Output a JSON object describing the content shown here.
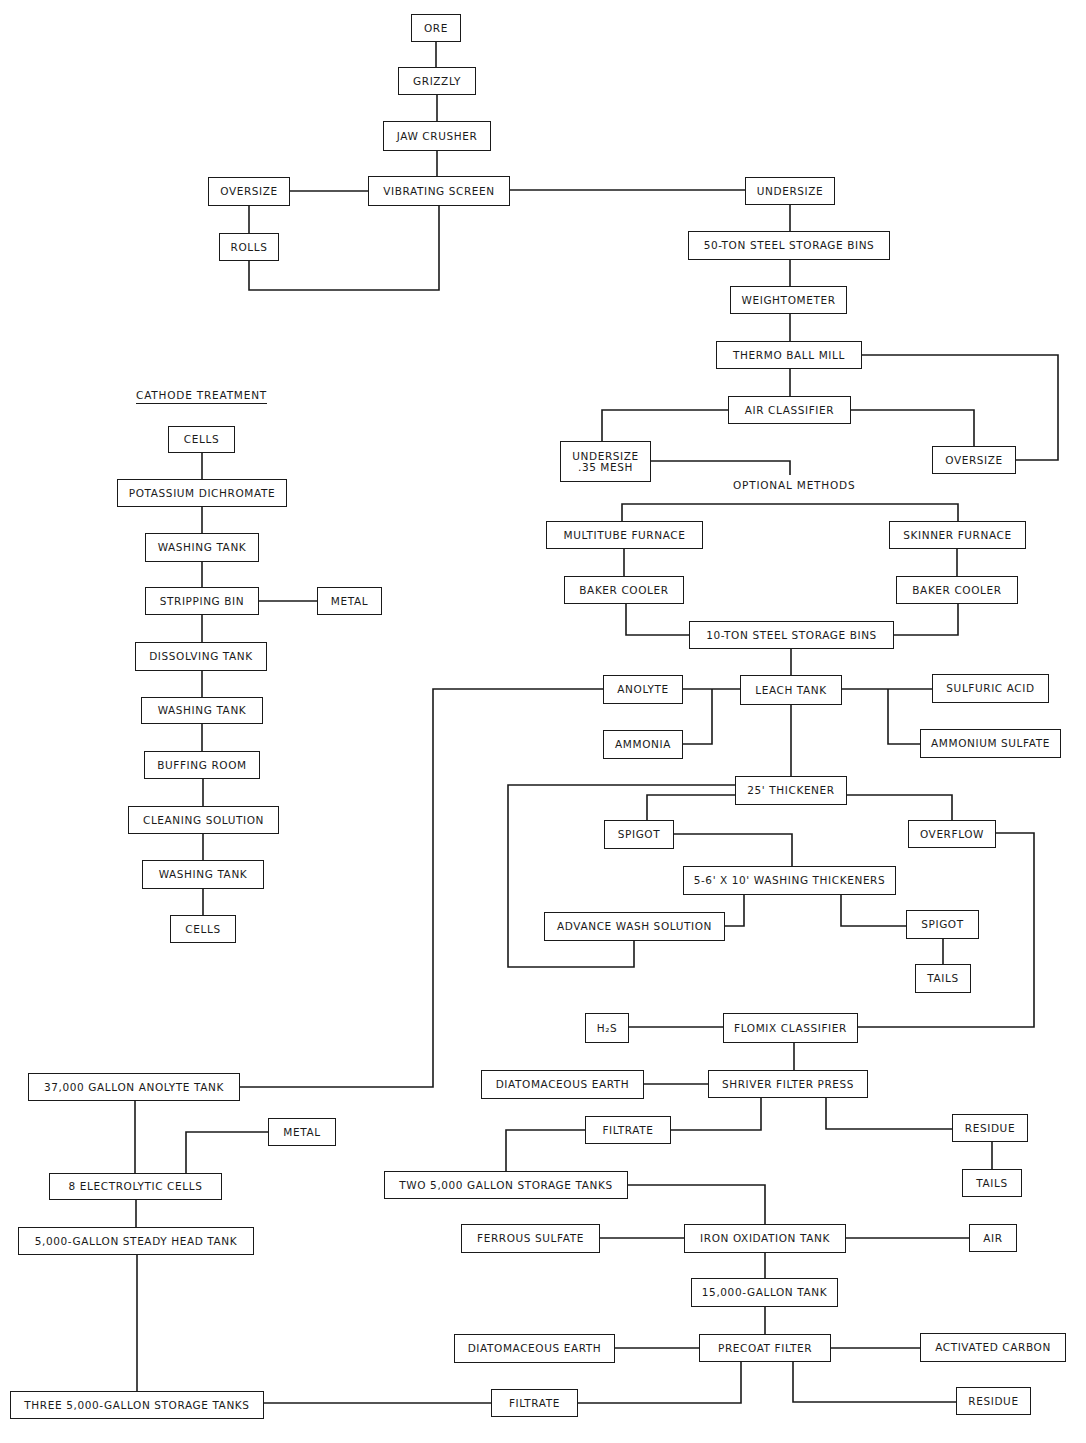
{
  "diagram": {
    "type": "process-flowsheet",
    "labels": {
      "cathode_treatment": "CATHODE TREATMENT",
      "optional_methods": "OPTIONAL METHODS"
    },
    "nodes": [
      {
        "id": "ore",
        "label": "ORE",
        "x": 411,
        "y": 14,
        "w": 50,
        "h": 28
      },
      {
        "id": "grizzly",
        "label": "GRIZZLY",
        "x": 398,
        "y": 67,
        "w": 78,
        "h": 28
      },
      {
        "id": "jaw_crusher",
        "label": "JAW CRUSHER",
        "x": 383,
        "y": 121,
        "w": 108,
        "h": 30
      },
      {
        "id": "vibrating_screen",
        "label": "VIBRATING SCREEN",
        "x": 368,
        "y": 176,
        "w": 142,
        "h": 30
      },
      {
        "id": "oversize_1",
        "label": "OVERSIZE",
        "x": 208,
        "y": 177,
        "w": 82,
        "h": 29
      },
      {
        "id": "rolls",
        "label": "ROLLS",
        "x": 219,
        "y": 233,
        "w": 60,
        "h": 28
      },
      {
        "id": "undersize_1",
        "label": "UNDERSIZE",
        "x": 745,
        "y": 177,
        "w": 90,
        "h": 28
      },
      {
        "id": "bins_50",
        "label": "50-TON STEEL STORAGE BINS",
        "x": 688,
        "y": 231,
        "w": 202,
        "h": 29
      },
      {
        "id": "weightometer",
        "label": "WEIGHTOMETER",
        "x": 730,
        "y": 286,
        "w": 117,
        "h": 28
      },
      {
        "id": "thermo_ball_mill",
        "label": "THERMO BALL MILL",
        "x": 716,
        "y": 341,
        "w": 146,
        "h": 28
      },
      {
        "id": "air_classifier",
        "label": "AIR CLASSIFIER",
        "x": 728,
        "y": 396,
        "w": 123,
        "h": 28
      },
      {
        "id": "undersize_35",
        "label": "UNDERSIZE\n.35 MESH",
        "x": 560,
        "y": 441,
        "w": 91,
        "h": 41
      },
      {
        "id": "oversize_2",
        "label": "OVERSIZE",
        "x": 932,
        "y": 446,
        "w": 84,
        "h": 28
      },
      {
        "id": "multitube_furnace",
        "label": "MULTITUBE FURNACE",
        "x": 546,
        "y": 521,
        "w": 157,
        "h": 28
      },
      {
        "id": "skinner_furnace",
        "label": "SKINNER FURNACE",
        "x": 889,
        "y": 521,
        "w": 137,
        "h": 28
      },
      {
        "id": "baker_cooler_1",
        "label": "BAKER COOLER",
        "x": 564,
        "y": 576,
        "w": 120,
        "h": 28
      },
      {
        "id": "baker_cooler_2",
        "label": "BAKER COOLER",
        "x": 896,
        "y": 576,
        "w": 122,
        "h": 28
      },
      {
        "id": "bins_10",
        "label": "10-TON STEEL STORAGE BINS",
        "x": 689,
        "y": 621,
        "w": 205,
        "h": 28
      },
      {
        "id": "leach_tank",
        "label": "LEACH TANK",
        "x": 740,
        "y": 675,
        "w": 102,
        "h": 30
      },
      {
        "id": "anolyte",
        "label": "ANOLYTE",
        "x": 603,
        "y": 675,
        "w": 80,
        "h": 29
      },
      {
        "id": "ammonia",
        "label": "AMMONIA",
        "x": 603,
        "y": 730,
        "w": 80,
        "h": 29
      },
      {
        "id": "sulfuric_acid",
        "label": "SULFURIC ACID",
        "x": 932,
        "y": 674,
        "w": 117,
        "h": 29
      },
      {
        "id": "ammonium_sulfate",
        "label": "AMMONIUM SULFATE",
        "x": 920,
        "y": 729,
        "w": 141,
        "h": 29
      },
      {
        "id": "thickener_25",
        "label": "25' THICKENER",
        "x": 735,
        "y": 776,
        "w": 112,
        "h": 29
      },
      {
        "id": "spigot_1",
        "label": "SPIGOT",
        "x": 604,
        "y": 820,
        "w": 70,
        "h": 29
      },
      {
        "id": "overflow",
        "label": "OVERFLOW",
        "x": 908,
        "y": 820,
        "w": 88,
        "h": 28
      },
      {
        "id": "washing_thickeners",
        "label": "5-6' X 10' WASHING THICKENERS",
        "x": 683,
        "y": 866,
        "w": 213,
        "h": 29
      },
      {
        "id": "advance_wash",
        "label": "ADVANCE WASH SOLUTION",
        "x": 544,
        "y": 912,
        "w": 181,
        "h": 29
      },
      {
        "id": "spigot_2",
        "label": "SPIGOT",
        "x": 906,
        "y": 910,
        "w": 73,
        "h": 29
      },
      {
        "id": "tails_1",
        "label": "TAILS",
        "x": 915,
        "y": 964,
        "w": 56,
        "h": 29
      },
      {
        "id": "h2s",
        "label": "H₂S",
        "x": 585,
        "y": 1013,
        "w": 44,
        "h": 30
      },
      {
        "id": "flomix_classifier",
        "label": "FLOMIX CLASSIFIER",
        "x": 723,
        "y": 1013,
        "w": 135,
        "h": 30
      },
      {
        "id": "diatomaceous_earth_1",
        "label": "DIATOMACEOUS EARTH",
        "x": 481,
        "y": 1070,
        "w": 163,
        "h": 29
      },
      {
        "id": "shriver_filter_press",
        "label": "SHRIVER FILTER PRESS",
        "x": 708,
        "y": 1070,
        "w": 160,
        "h": 28
      },
      {
        "id": "filtrate_1",
        "label": "FILTRATE",
        "x": 585,
        "y": 1116,
        "w": 86,
        "h": 28
      },
      {
        "id": "residue_1",
        "label": "RESIDUE",
        "x": 952,
        "y": 1114,
        "w": 76,
        "h": 28
      },
      {
        "id": "two_5000_tanks",
        "label": "TWO 5,000 GALLON STORAGE TANKS",
        "x": 384,
        "y": 1171,
        "w": 244,
        "h": 28
      },
      {
        "id": "tails_2",
        "label": "TAILS",
        "x": 962,
        "y": 1169,
        "w": 60,
        "h": 28
      },
      {
        "id": "ferrous_sulfate",
        "label": "FERROUS SULFATE",
        "x": 461,
        "y": 1224,
        "w": 139,
        "h": 29
      },
      {
        "id": "iron_oxidation_tank",
        "label": "IRON OXIDATION TANK",
        "x": 684,
        "y": 1224,
        "w": 162,
        "h": 29
      },
      {
        "id": "air",
        "label": "AIR",
        "x": 969,
        "y": 1224,
        "w": 48,
        "h": 28
      },
      {
        "id": "tank_15000",
        "label": "15,000-GALLON TANK",
        "x": 691,
        "y": 1278,
        "w": 147,
        "h": 29
      },
      {
        "id": "diatomaceous_earth_2",
        "label": "DIATOMACEOUS EARTH",
        "x": 454,
        "y": 1334,
        "w": 161,
        "h": 29
      },
      {
        "id": "precoat_filter",
        "label": "PRECOAT FILTER",
        "x": 699,
        "y": 1334,
        "w": 132,
        "h": 28
      },
      {
        "id": "activated_carbon",
        "label": "ACTIVATED CARBON",
        "x": 920,
        "y": 1333,
        "w": 146,
        "h": 29
      },
      {
        "id": "filtrate_2",
        "label": "FILTRATE",
        "x": 491,
        "y": 1389,
        "w": 87,
        "h": 28
      },
      {
        "id": "residue_2",
        "label": "RESIDUE",
        "x": 956,
        "y": 1387,
        "w": 75,
        "h": 28
      },
      {
        "id": "cells_1",
        "label": "CELLS",
        "x": 168,
        "y": 426,
        "w": 67,
        "h": 27
      },
      {
        "id": "potassium_dichromate",
        "label": "POTASSIUM DICHROMATE",
        "x": 117,
        "y": 479,
        "w": 170,
        "h": 28
      },
      {
        "id": "washing_tank_1",
        "label": "WASHING TANK",
        "x": 145,
        "y": 533,
        "w": 114,
        "h": 29
      },
      {
        "id": "stripping_bin",
        "label": "STRIPPING BIN",
        "x": 145,
        "y": 587,
        "w": 114,
        "h": 28
      },
      {
        "id": "metal_1",
        "label": "METAL",
        "x": 317,
        "y": 587,
        "w": 65,
        "h": 28
      },
      {
        "id": "dissolving_tank",
        "label": "DISSOLVING TANK",
        "x": 135,
        "y": 642,
        "w": 132,
        "h": 29
      },
      {
        "id": "washing_tank_2",
        "label": "WASHING TANK",
        "x": 141,
        "y": 697,
        "w": 122,
        "h": 27
      },
      {
        "id": "buffing_room",
        "label": "BUFFING ROOM",
        "x": 144,
        "y": 751,
        "w": 116,
        "h": 28
      },
      {
        "id": "cleaning_solution",
        "label": "CLEANING SOLUTION",
        "x": 128,
        "y": 806,
        "w": 151,
        "h": 28
      },
      {
        "id": "washing_tank_3",
        "label": "WASHING TANK",
        "x": 142,
        "y": 860,
        "w": 122,
        "h": 29
      },
      {
        "id": "cells_2",
        "label": "CELLS",
        "x": 170,
        "y": 915,
        "w": 66,
        "h": 28
      },
      {
        "id": "anolyte_tank",
        "label": "37,000 GALLON ANOLYTE TANK",
        "x": 28,
        "y": 1073,
        "w": 212,
        "h": 28
      },
      {
        "id": "metal_2",
        "label": "METAL",
        "x": 268,
        "y": 1118,
        "w": 68,
        "h": 28
      },
      {
        "id": "electrolytic_cells",
        "label": "8 ELECTROLYTIC CELLS",
        "x": 49,
        "y": 1173,
        "w": 173,
        "h": 27
      },
      {
        "id": "steady_head_tank",
        "label": "5,000-GALLON STEADY HEAD TANK",
        "x": 18,
        "y": 1227,
        "w": 236,
        "h": 28
      },
      {
        "id": "three_5000_tanks",
        "label": "THREE 5,000-GALLON STORAGE TANKS",
        "x": 10,
        "y": 1391,
        "w": 254,
        "h": 28
      }
    ]
  }
}
